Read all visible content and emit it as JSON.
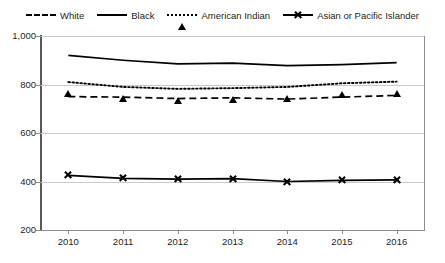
{
  "chart_data": {
    "type": "line",
    "title": "",
    "xlabel": "",
    "ylabel": "",
    "x": [
      2010,
      2011,
      2012,
      2013,
      2014,
      2015,
      2016
    ],
    "categories": [
      "2010",
      "2011",
      "2012",
      "2013",
      "2014",
      "2015",
      "2016"
    ],
    "xtick_labels": [
      "2010",
      "2011",
      "2012",
      "2013",
      "2014",
      "2015",
      "2016"
    ],
    "ytick_labels": [
      "1,000",
      "800",
      "600",
      "400",
      "200"
    ],
    "ytick_values": [
      1000,
      800,
      600,
      400,
      200
    ],
    "ylim": [
      200,
      1000
    ],
    "grid": "horizontal",
    "legend_position": "top-center",
    "series": [
      {
        "name": "White",
        "marker": "diamond",
        "line_style": "dashed",
        "color": "#000000",
        "values": [
          750,
          748,
          742,
          745,
          740,
          748,
          755
        ]
      },
      {
        "name": "Black",
        "marker": "square",
        "line_style": "solid",
        "color": "#000000",
        "values": [
          920,
          900,
          885,
          888,
          878,
          882,
          890
        ]
      },
      {
        "name": "American Indian",
        "marker": "triangle",
        "line_style": "dotted",
        "color": "#000000",
        "values": [
          810,
          790,
          782,
          785,
          790,
          805,
          812
        ]
      },
      {
        "name": "Asian or Pacific Islander",
        "marker": "cross",
        "line_style": "solid",
        "color": "#000000",
        "values": [
          425,
          413,
          410,
          412,
          400,
          405,
          407
        ]
      }
    ]
  },
  "legend": {
    "items": [
      {
        "label": "White",
        "marker": "diamond-marker",
        "style": "dashed"
      },
      {
        "label": "Black",
        "marker": "square-marker",
        "style": "solid"
      },
      {
        "label": "American Indian",
        "marker": "triangle-marker",
        "style": "dotted"
      },
      {
        "label": "Asian or Pacific Islander",
        "marker": "cross-marker",
        "style": "solid"
      }
    ]
  },
  "axes": {
    "y_labels": [
      "1,000",
      "800",
      "600",
      "400",
      "200"
    ],
    "x_labels": [
      "2010",
      "2011",
      "2012",
      "2013",
      "2014",
      "2015",
      "2016"
    ]
  },
  "colors": {
    "series": "#000000",
    "gridline": "#c9c9c9",
    "axis": "#8c8c8c",
    "text": "#231f20",
    "background": "#ffffff"
  }
}
